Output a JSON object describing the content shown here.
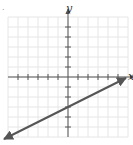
{
  "figure": {
    "marker": ".",
    "x_axis_label": "x",
    "y_axis_label": "y"
  },
  "colors": {
    "grid": "#e6e6e6",
    "axis": "#555555",
    "line": "#555555"
  },
  "chart_data": {
    "type": "line",
    "title": "",
    "xlabel": "x",
    "ylabel": "y",
    "xlim": [
      -6,
      6
    ],
    "ylim": [
      -6,
      6
    ],
    "grid": true,
    "tick_spacing": 1,
    "tick_labels_shown": false,
    "series": [
      {
        "name": "y = 1/2 x - 3",
        "equation": "y = 0.5x - 3",
        "slope": 0.5,
        "y_intercept": -3,
        "arrows_both_ends": true,
        "x": [
          -6,
          -4,
          -2,
          0,
          2,
          4,
          6
        ],
        "values": [
          -6,
          -5,
          -4,
          -3,
          -2,
          -1,
          0
        ]
      }
    ]
  }
}
